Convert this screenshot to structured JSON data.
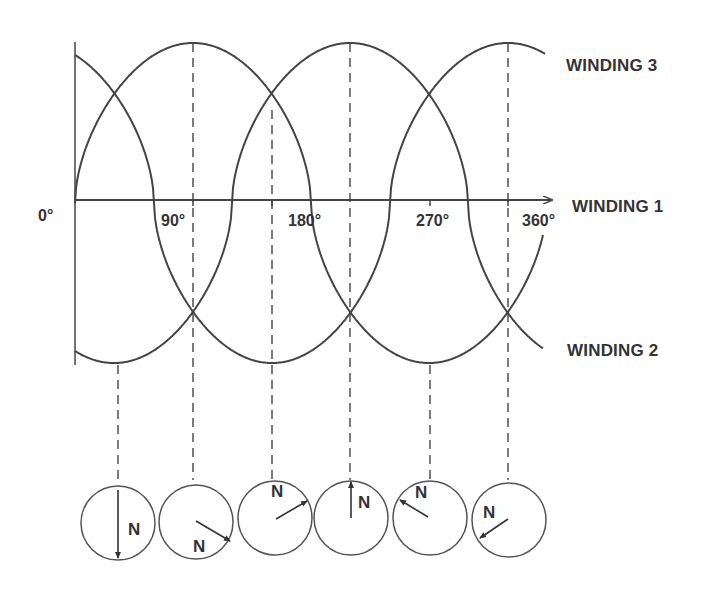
{
  "diagram": {
    "axis_labels": {
      "deg0": "0°",
      "deg90": "90°",
      "deg180": "180°",
      "deg270": "270°",
      "deg360": "360°"
    },
    "windings": {
      "w3": "WINDING 3",
      "w1": "WINDING 1",
      "w2": "WINDING 2"
    },
    "pole_label": "N",
    "rotor_positions": [
      {
        "index": 1,
        "arrow_direction": "down",
        "label": "N"
      },
      {
        "index": 2,
        "arrow_direction": "down-right",
        "label": "N"
      },
      {
        "index": 3,
        "arrow_direction": "up-right",
        "label": "N"
      },
      {
        "index": 4,
        "arrow_direction": "up",
        "label": "N"
      },
      {
        "index": 5,
        "arrow_direction": "up-left",
        "label": "N"
      },
      {
        "index": 6,
        "arrow_direction": "down-left",
        "label": "N"
      }
    ],
    "colors": {
      "line": "#444444",
      "text": "#333333",
      "background": "#ffffff"
    }
  }
}
